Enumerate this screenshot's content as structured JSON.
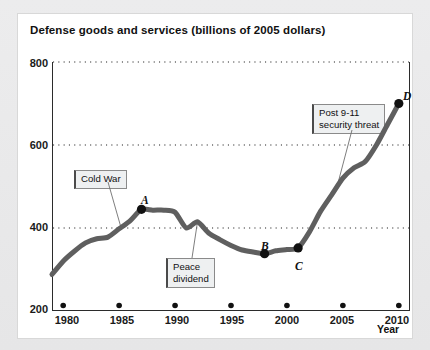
{
  "chart_data": {
    "type": "line",
    "title": "Defense goods and services (billions of 2005 dollars)",
    "xlabel": "Year",
    "ylabel": "",
    "xlim": [
      1979,
      2011
    ],
    "ylim": [
      200,
      800
    ],
    "yticks": [
      200,
      400,
      600,
      800
    ],
    "xticks": [
      1980,
      1985,
      1990,
      1995,
      2000,
      2005,
      2010
    ],
    "grid": "horizontal-dotted",
    "legend": "none",
    "line_color": "#5f5f5f",
    "series": [
      {
        "name": "Defense goods and services",
        "x": [
          1979,
          1980,
          1981,
          1982,
          1983,
          1984,
          1985,
          1986,
          1987,
          1988,
          1989,
          1990,
          1991,
          1992,
          1993,
          1994,
          1995,
          1996,
          1997,
          1998,
          1999,
          2000,
          2001,
          2002,
          2003,
          2004,
          2005,
          2006,
          2007,
          2008,
          2009,
          2010
        ],
        "values": [
          288,
          320,
          344,
          364,
          374,
          378,
          398,
          418,
          445,
          443,
          443,
          438,
          400,
          415,
          388,
          372,
          358,
          347,
          342,
          338,
          345,
          348,
          352,
          390,
          440,
          480,
          520,
          545,
          560,
          600,
          650,
          700
        ]
      }
    ],
    "markers": [
      {
        "label": "A",
        "x": 1987,
        "y": 445,
        "label_pos": "above"
      },
      {
        "label": "B",
        "x": 1998,
        "y": 338,
        "label_pos": "above-left"
      },
      {
        "label": "C",
        "x": 2001,
        "y": 352,
        "label_pos": "below-right"
      },
      {
        "label": "D",
        "x": 2010,
        "y": 700,
        "label_pos": "above-right"
      }
    ],
    "annotations": [
      {
        "text": "Cold War",
        "target_x": 1985,
        "target_y": 400
      },
      {
        "text": "Peace\ndividend",
        "target_x": 1992,
        "target_y": 415
      },
      {
        "text": "Post 9-11\nsecurity threat",
        "target_x": 2005,
        "target_y": 520
      }
    ]
  },
  "axis": {
    "y_ticks": [
      "800",
      "600",
      "400",
      "200"
    ],
    "x_ticks": [
      "1980",
      "1985",
      "1990",
      "1995",
      "2000",
      "2005",
      "2010"
    ],
    "x_axis_name": "Year"
  },
  "callouts": {
    "cold_war": "Cold War",
    "peace_dividend": "Peace\ndividend",
    "post_911": "Post 9-11\nsecurity threat"
  },
  "markers": {
    "a": "A",
    "b": "B",
    "c": "C",
    "d": "D"
  },
  "title": "Defense goods and services (billions of 2005 dollars)"
}
